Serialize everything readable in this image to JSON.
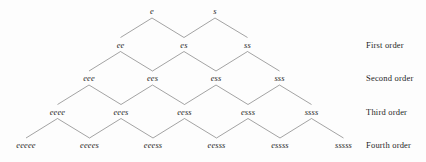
{
  "diagram": {
    "background_color": "#fdfdfd",
    "edge_color": "#585858",
    "text_color": "#2b2b2b",
    "geometry": {
      "x_step": 63.5,
      "y_step": 33.5,
      "row0_y": 11,
      "row0_center_x": 183.5
    },
    "rows": [
      {
        "index": 0,
        "order_label": "",
        "y": 11,
        "nodes": [
          {
            "label": "e",
            "x": 152
          },
          {
            "label": "s",
            "x": 215
          }
        ]
      },
      {
        "index": 1,
        "order_label": "First order",
        "y": 44.5,
        "nodes": [
          {
            "label": "ee",
            "x": 120.5
          },
          {
            "label": "es",
            "x": 184
          },
          {
            "label": "ss",
            "x": 247.5
          }
        ]
      },
      {
        "index": 2,
        "order_label": "Second order",
        "y": 78,
        "nodes": [
          {
            "label": "eee",
            "x": 89
          },
          {
            "label": "ees",
            "x": 152.5
          },
          {
            "label": "ess",
            "x": 216
          },
          {
            "label": "sss",
            "x": 279.5
          }
        ]
      },
      {
        "index": 3,
        "order_label": "Third order",
        "y": 111.5,
        "nodes": [
          {
            "label": "eeee",
            "x": 57.5
          },
          {
            "label": "eees",
            "x": 121
          },
          {
            "label": "eess",
            "x": 184.5
          },
          {
            "label": "esss",
            "x": 248
          },
          {
            "label": "ssss",
            "x": 311.5
          }
        ]
      },
      {
        "index": 4,
        "order_label": "Fourth order",
        "y": 145,
        "nodes": [
          {
            "label": "eeeee",
            "x": 26
          },
          {
            "label": "eeees",
            "x": 89.5
          },
          {
            "label": "eeess",
            "x": 153
          },
          {
            "label": "eesss",
            "x": 216.5
          },
          {
            "label": "essss",
            "x": 280
          },
          {
            "label": "sssss",
            "x": 343.5
          }
        ]
      }
    ],
    "order_labels": [
      {
        "text": "First order",
        "x": 366,
        "y": 44.5
      },
      {
        "text": "Second order",
        "x": 366,
        "y": 78
      },
      {
        "text": "Third order",
        "x": 366,
        "y": 111.5
      },
      {
        "text": "Fourth order",
        "x": 366,
        "y": 145
      }
    ]
  }
}
